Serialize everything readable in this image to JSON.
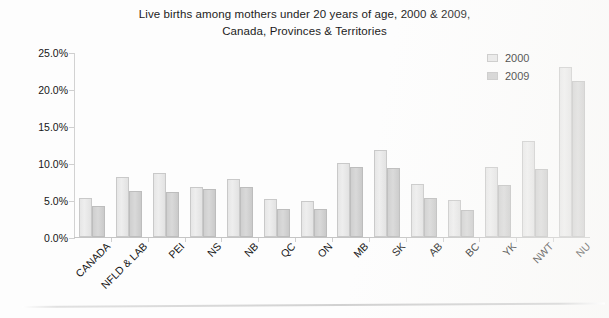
{
  "chart_data": {
    "type": "bar",
    "title": "Live births among mothers under 20 years of age, 2000 & 2009, Canada, Provinces & Territories",
    "title_lines": [
      "Live births among mothers under 20 years of age, 2000 & 2009,",
      "Canada, Provinces & Territories"
    ],
    "xlabel": "",
    "ylabel": "",
    "ylim": [
      0,
      25
    ],
    "ytick_values": [
      0,
      5,
      10,
      15,
      20,
      25
    ],
    "ytick_labels": [
      "0.0%",
      "5.0%",
      "10.0%",
      "15.0%",
      "20.0%",
      "25.0%"
    ],
    "grid": false,
    "legend_position": "top-right",
    "categories": [
      "CANADA",
      "NFLD & LAB",
      "PEI",
      "NS",
      "NB",
      "QC",
      "ON",
      "MB",
      "SK",
      "AB",
      "BC",
      "YK",
      "NWT",
      "NU"
    ],
    "series": [
      {
        "name": "2000",
        "color": "#e8e8e8",
        "values": [
          5.3,
          8.1,
          8.6,
          6.7,
          7.9,
          5.1,
          4.8,
          10.0,
          11.8,
          7.2,
          5.0,
          9.4,
          13.0,
          23.0
        ]
      },
      {
        "name": "2009",
        "color": "#d0d0d0",
        "values": [
          4.2,
          6.2,
          6.1,
          6.5,
          6.8,
          3.8,
          3.8,
          9.4,
          9.3,
          5.3,
          3.6,
          7.0,
          9.2,
          21.1
        ]
      }
    ]
  }
}
